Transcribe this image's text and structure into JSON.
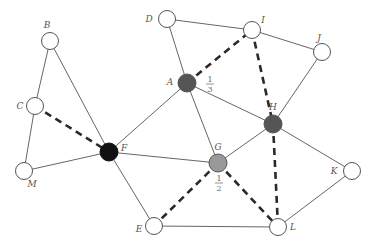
{
  "diagram": {
    "type": "graph",
    "colors": {
      "edge": "#555555",
      "dashed_edge": "#2a2a2a",
      "node_white": "#ffffff",
      "node_outline": "#555555",
      "node_black": "#111111",
      "node_dark_gray": "#555555",
      "node_light_gray": "#999999"
    },
    "nodes": [
      {
        "id": "B",
        "label": "B",
        "x": 50,
        "y": 41,
        "fill": "white",
        "label_dx": -3,
        "label_dy": -13
      },
      {
        "id": "C",
        "label": "C",
        "x": 35,
        "y": 106,
        "fill": "white",
        "label_dx": -15,
        "label_dy": 3
      },
      {
        "id": "M",
        "label": "M",
        "x": 24,
        "y": 171,
        "fill": "white",
        "label_dx": 8,
        "label_dy": 16
      },
      {
        "id": "F",
        "label": "F",
        "x": 109,
        "y": 152,
        "fill": "black",
        "label_dx": 15,
        "label_dy": -1
      },
      {
        "id": "A",
        "label": "A",
        "x": 187,
        "y": 83,
        "fill": "darkgray",
        "label_dx": -17,
        "label_dy": 2
      },
      {
        "id": "D",
        "label": "D",
        "x": 167,
        "y": 19,
        "fill": "white",
        "label_dx": -18,
        "label_dy": 3
      },
      {
        "id": "I",
        "label": "I",
        "x": 252,
        "y": 30,
        "fill": "white",
        "label_dx": 11,
        "label_dy": -7
      },
      {
        "id": "J",
        "label": "J",
        "x": 322,
        "y": 52,
        "fill": "white",
        "label_dx": -3,
        "label_dy": -11
      },
      {
        "id": "H",
        "label": "H",
        "x": 273,
        "y": 124,
        "fill": "darkgray",
        "label_dx": 0,
        "label_dy": -14
      },
      {
        "id": "G",
        "label": "G",
        "x": 218,
        "y": 163,
        "fill": "lightgray",
        "label_dx": 0,
        "label_dy": -13
      },
      {
        "id": "K",
        "label": "K",
        "x": 352,
        "y": 171,
        "fill": "white",
        "label_dx": -18,
        "label_dy": 3
      },
      {
        "id": "L",
        "label": "L",
        "x": 278,
        "y": 227,
        "fill": "white",
        "label_dx": 15,
        "label_dy": 3
      },
      {
        "id": "E",
        "label": "E",
        "x": 154,
        "y": 226,
        "fill": "white",
        "label_dx": -15,
        "label_dy": 6
      }
    ],
    "edges": [
      {
        "from": "B",
        "to": "C",
        "style": "solid"
      },
      {
        "from": "B",
        "to": "F",
        "style": "solid"
      },
      {
        "from": "C",
        "to": "M",
        "style": "solid"
      },
      {
        "from": "C",
        "to": "F",
        "style": "dashed"
      },
      {
        "from": "M",
        "to": "F",
        "style": "solid"
      },
      {
        "from": "F",
        "to": "A",
        "style": "solid"
      },
      {
        "from": "F",
        "to": "G",
        "style": "solid"
      },
      {
        "from": "F",
        "to": "E",
        "style": "solid"
      },
      {
        "from": "A",
        "to": "D",
        "style": "solid"
      },
      {
        "from": "A",
        "to": "I",
        "style": "dashed"
      },
      {
        "from": "A",
        "to": "G",
        "style": "solid"
      },
      {
        "from": "A",
        "to": "H",
        "style": "solid"
      },
      {
        "from": "D",
        "to": "I",
        "style": "solid"
      },
      {
        "from": "I",
        "to": "J",
        "style": "solid"
      },
      {
        "from": "I",
        "to": "H",
        "style": "dashed"
      },
      {
        "from": "J",
        "to": "H",
        "style": "solid"
      },
      {
        "from": "H",
        "to": "G",
        "style": "solid"
      },
      {
        "from": "H",
        "to": "K",
        "style": "solid"
      },
      {
        "from": "H",
        "to": "L",
        "style": "dashed"
      },
      {
        "from": "G",
        "to": "E",
        "style": "dashed"
      },
      {
        "from": "G",
        "to": "L",
        "style": "dashed"
      },
      {
        "from": "E",
        "to": "L",
        "style": "solid"
      },
      {
        "from": "K",
        "to": "L",
        "style": "solid"
      }
    ],
    "annotations": [
      {
        "node": "A",
        "numerator": "1",
        "denominator": "3",
        "x": 210,
        "y": 84
      },
      {
        "node": "G",
        "numerator": "1",
        "denominator": "2",
        "x": 219,
        "y": 183
      }
    ]
  }
}
